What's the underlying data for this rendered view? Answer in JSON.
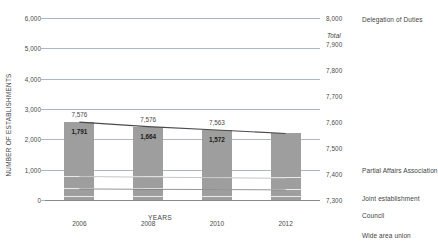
{
  "chart_data": {
    "type": "bar",
    "title": "",
    "xlabel": "YEARS",
    "ylabel": "NUMBER OF ESTABLISHMENTS",
    "categories": [
      "2006",
      "2008",
      "2010",
      "2012"
    ],
    "ylim": [
      0,
      6000
    ],
    "yticks": [
      "0",
      "1,000",
      "2,000",
      "3,000",
      "4,000",
      "5,000",
      "6,000"
    ],
    "ytick_values": [
      0,
      1000,
      2000,
      3000,
      4000,
      5000,
      6000
    ],
    "y2lim": [
      7300,
      8000
    ],
    "y2ticks": [
      "7,300",
      "7,400",
      "7,500",
      "7,600",
      "7,700",
      "7,800",
      "7,900",
      "8,000"
    ],
    "y2tick_values": [
      7300,
      7400,
      7500,
      7600,
      7700,
      7800,
      7900,
      8000
    ],
    "grid": true,
    "legend_position": "right",
    "secondary_axis_note": "Total",
    "series": [
      {
        "name": "Partial Affairs Association",
        "type": "bar-stack",
        "values": [
          1791,
          1664,
          1572,
          1480
        ],
        "labels": [
          "1,791",
          "1,664",
          "1,572",
          ""
        ]
      },
      {
        "name": "Joint establishment",
        "type": "bar-stack",
        "values": [
          410,
          400,
          390,
          380
        ],
        "labels": [
          "",
          "",
          "",
          ""
        ]
      },
      {
        "name": "Council",
        "type": "bar-stack",
        "values": [
          250,
          240,
          235,
          225
        ],
        "labels": [
          "",
          "",
          "",
          ""
        ]
      },
      {
        "name": "Wide area union",
        "type": "bar-stack",
        "values": [
          115,
          112,
          110,
          108
        ],
        "labels": [
          "",
          "",
          "",
          ""
        ]
      },
      {
        "name": "Delegation of Duties",
        "type": "line",
        "values": [
          5036,
          5109,
          5264,
          5620
        ],
        "labels": [
          "5,036",
          "5,109",
          "5,264",
          ""
        ]
      },
      {
        "name": "Total",
        "type": "bar-total",
        "values": [
          7576,
          7576,
          7563,
          7890
        ],
        "labels": [
          "7,576",
          "7,576",
          "7,563",
          ""
        ]
      }
    ],
    "bar_totals": [
      "7,576",
      "7,576",
      "7,563",
      ""
    ],
    "colors": {
      "bar": "#9e9e9e",
      "gridline": "#a9b7c6",
      "line_delegation": "#a0a0a0",
      "line_partial": "#4a4a4a",
      "line_joint": "#b8b8b8",
      "line_council": "#7a7a7a",
      "text": "#3f3f3f"
    }
  },
  "legend": {
    "items": [
      {
        "label": "Delegation of Duties"
      },
      {
        "label": "Partial Affairs Association"
      },
      {
        "label": "Joint establishment"
      },
      {
        "label": "Council"
      },
      {
        "label": "Wide area union"
      }
    ]
  },
  "annotations": {
    "total": "Total"
  }
}
